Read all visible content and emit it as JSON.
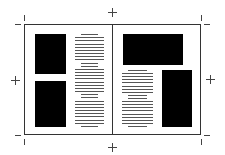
{
  "diagram": {
    "colors": {
      "image_block": "#000000",
      "text_line": "#555555",
      "frame": "#333333",
      "background": "#ffffff"
    },
    "left_page": {
      "images": [
        {
          "name": "image-top-left",
          "x": 35,
          "y": 34,
          "w": 31,
          "h": 40
        },
        {
          "name": "image-bottom-left",
          "x": 35,
          "y": 81,
          "w": 31,
          "h": 46
        }
      ],
      "text_column": {
        "x": 75,
        "y": 34,
        "w": 29,
        "h": 93,
        "lines": 30
      }
    },
    "right_page": {
      "images": [
        {
          "name": "image-top-right",
          "x": 123,
          "y": 34,
          "w": 60,
          "h": 31
        },
        {
          "name": "image-bottom-right",
          "x": 162,
          "y": 70,
          "w": 30,
          "h": 57
        }
      ],
      "text_column": {
        "x": 122,
        "y": 70,
        "w": 31,
        "h": 57,
        "lines": 19
      }
    }
  }
}
